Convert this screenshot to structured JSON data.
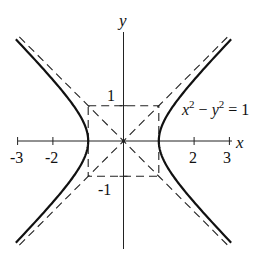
{
  "chart_data": {
    "type": "line",
    "title": "",
    "equation": "x² − y² = 1",
    "equation_parts": {
      "x": "x",
      "sup1": "2",
      "minus": " − ",
      "y": "y",
      "sup2": "2",
      "rhs": " = 1"
    },
    "xlabel": "x",
    "ylabel": "y",
    "xlim": [
      -3,
      3
    ],
    "ylim": [
      -3,
      3
    ],
    "x_ticks": [
      -3,
      -2,
      2,
      3
    ],
    "x_tick_labels": [
      "-3",
      "-2",
      "2",
      "3"
    ],
    "y_ticks": [
      1,
      -1
    ],
    "y_tick_labels": [
      "1",
      "-1"
    ],
    "series": [
      {
        "name": "hyperbola",
        "equation": "x^2 - y^2 = 1",
        "style": "solid",
        "vertices": [
          [
            -1,
            0
          ],
          [
            1,
            0
          ]
        ]
      },
      {
        "name": "asymptote y = x",
        "style": "dashed"
      },
      {
        "name": "asymptote y = -x",
        "style": "dashed"
      },
      {
        "name": "box",
        "style": "dashed",
        "corners": [
          [
            -1,
            1
          ],
          [
            1,
            1
          ],
          [
            1,
            -1
          ],
          [
            -1,
            -1
          ]
        ]
      }
    ],
    "grid": false,
    "legend": "none"
  }
}
